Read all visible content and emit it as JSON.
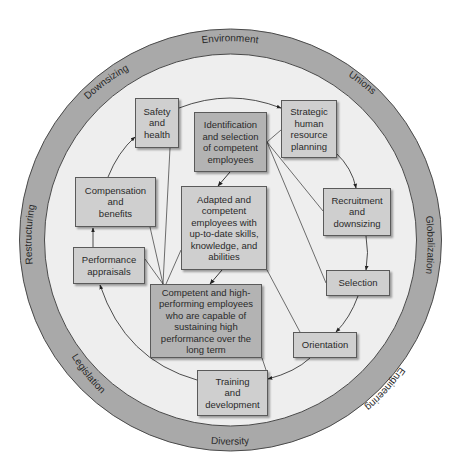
{
  "diagram": {
    "type": "circular-process-diagram",
    "colors": {
      "ring_fill": "#a9a9a9",
      "inner_fill": "#eeeeee",
      "box_fill": "#cfcfcf",
      "box_fill_dark": "#b3b3b3",
      "border": "#5a5a5a",
      "text": "#2a2a2a"
    },
    "outer_ring_labels": [
      {
        "id": "environment",
        "label": "Environment"
      },
      {
        "id": "unions",
        "label": "Unions"
      },
      {
        "id": "globalization",
        "label": "Globalization"
      },
      {
        "id": "engineering",
        "label": "Engineering"
      },
      {
        "id": "diversity",
        "label": "Diversity"
      },
      {
        "id": "legislation",
        "label": "Legislation"
      },
      {
        "id": "restructuring",
        "label": "Restructuring"
      },
      {
        "id": "downsizing",
        "label": "Downsizing"
      }
    ],
    "process_boxes": [
      {
        "id": "strategic-hr-planning",
        "label": "Strategic\nhuman\nresource\nplanning"
      },
      {
        "id": "recruitment-downsizing",
        "label": "Recruitment\nand\ndownsizing"
      },
      {
        "id": "selection",
        "label": "Selection"
      },
      {
        "id": "orientation",
        "label": "Orientation"
      },
      {
        "id": "training-development",
        "label": "Training\nand\ndevelopment"
      },
      {
        "id": "performance-appraisals",
        "label": "Performance\nappraisals"
      },
      {
        "id": "compensation-benefits",
        "label": "Compensation\nand\nbenefits"
      },
      {
        "id": "safety-health",
        "label": "Safety\nand\nhealth"
      }
    ],
    "outcome_boxes": [
      {
        "id": "identification-selection",
        "label": "Identification\nand selection\nof competent\nemployees"
      },
      {
        "id": "adapted-competent",
        "label": "Adapted and\ncompetent\nemployees with\nup-to-date skills,\nknowledge, and\nabilities"
      },
      {
        "id": "competent-high-performing",
        "label": "Competent and high-\nperforming employees\nwho are capable of\nsustaining high\nperformance over the\nlong term"
      }
    ]
  }
}
